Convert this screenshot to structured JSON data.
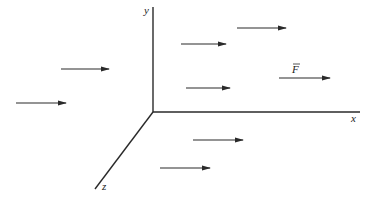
{
  "diagram": {
    "type": "3d-coordinate-axes-with-uniform-vector-field",
    "colors": {
      "stroke": "#2a2a2a",
      "background": "#ffffff"
    },
    "origin": {
      "x": 153,
      "y": 112
    },
    "axes": [
      {
        "name": "y",
        "label": "y",
        "x1": 153,
        "y1": 112,
        "x2": 153,
        "y2": 7,
        "label_x": 144,
        "label_y": 14
      },
      {
        "name": "x",
        "label": "x",
        "x1": 153,
        "y1": 112,
        "x2": 360,
        "y2": 112,
        "label_x": 351,
        "label_y": 122
      },
      {
        "name": "z",
        "label": "z",
        "x1": 153,
        "y1": 112,
        "x2": 95,
        "y2": 189,
        "label_x": 102,
        "label_y": 190
      }
    ],
    "vector_label": {
      "text": "F",
      "overbar": true,
      "x": 292,
      "y": 73
    },
    "arrows": [
      {
        "x1": 61,
        "y1": 69,
        "x2": 109,
        "y2": 69
      },
      {
        "x1": 16,
        "y1": 103,
        "x2": 66,
        "y2": 103
      },
      {
        "x1": 181,
        "y1": 44,
        "x2": 226,
        "y2": 44
      },
      {
        "x1": 237,
        "y1": 28,
        "x2": 286,
        "y2": 28
      },
      {
        "x1": 186,
        "y1": 88,
        "x2": 230,
        "y2": 88
      },
      {
        "x1": 279,
        "y1": 78,
        "x2": 330,
        "y2": 78
      },
      {
        "x1": 193,
        "y1": 140,
        "x2": 243,
        "y2": 140
      },
      {
        "x1": 160,
        "y1": 168,
        "x2": 210,
        "y2": 168
      }
    ]
  }
}
